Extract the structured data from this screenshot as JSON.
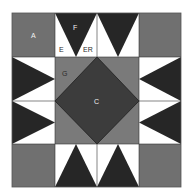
{
  "diagram": {
    "colors": {
      "corner": "#707070",
      "dark": "#262626",
      "white": "#ffffff",
      "center_square": "#7a7a7a",
      "diamond": "#3c3c3c",
      "outline": "#1e1e1e"
    },
    "labels": {
      "A": "A",
      "F": "F",
      "E": "E",
      "ER": "ER",
      "G": "G",
      "C": "C"
    },
    "pieces": [
      {
        "id": "A",
        "description": "corner square (x4)"
      },
      {
        "id": "F",
        "description": "dark star-point triangle (x8)"
      },
      {
        "id": "E",
        "description": "white background triangle"
      },
      {
        "id": "ER",
        "description": "white background triangle, reversed"
      },
      {
        "id": "G",
        "description": "center square corner triangles"
      },
      {
        "id": "C",
        "description": "center diamond"
      }
    ]
  }
}
